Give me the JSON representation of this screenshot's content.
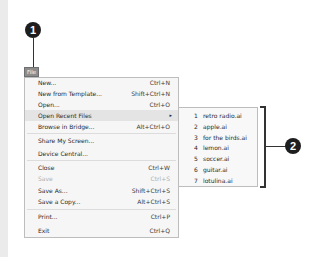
{
  "callouts": [
    {
      "number": "1",
      "target": "File menu"
    },
    {
      "number": "2",
      "target": "Recent files submenu"
    }
  ],
  "menubar": {
    "file_label": "File"
  },
  "file_menu": {
    "items": [
      {
        "label": "New...",
        "shortcut": "Ctrl+N"
      },
      {
        "label": "New from Template...",
        "shortcut": "Shift+Ctrl+N"
      },
      {
        "label": "Open...",
        "shortcut": "Ctrl+O"
      },
      {
        "label": "Open Recent Files",
        "shortcut": "",
        "submenu_arrow": "▸"
      },
      {
        "label": "Browse in Bridge...",
        "shortcut": "Alt+Ctrl+O"
      },
      {
        "label": "Share My Screen...",
        "shortcut": ""
      },
      {
        "label": "Device Central...",
        "shortcut": ""
      },
      {
        "label": "Close",
        "shortcut": "Ctrl+W"
      },
      {
        "label": "Save",
        "shortcut": "Ctrl+S",
        "disabled": true
      },
      {
        "label": "Save As...",
        "shortcut": "Shift+Ctrl+S"
      },
      {
        "label": "Save a Copy...",
        "shortcut": "Alt+Ctrl+S"
      },
      {
        "label": "Print...",
        "shortcut": "Ctrl+P"
      },
      {
        "label": "Exit",
        "shortcut": "Ctrl+Q"
      }
    ]
  },
  "recent_files": {
    "items": [
      {
        "num": "1",
        "name": "retro radio.ai"
      },
      {
        "num": "2",
        "name": "apple.ai"
      },
      {
        "num": "3",
        "name": "for the birds.ai"
      },
      {
        "num": "4",
        "name": "lemon.ai"
      },
      {
        "num": "5",
        "name": "soccer.ai"
      },
      {
        "num": "6",
        "name": "guitar.ai"
      },
      {
        "num": "7",
        "name": "lotulina.ai"
      }
    ]
  }
}
